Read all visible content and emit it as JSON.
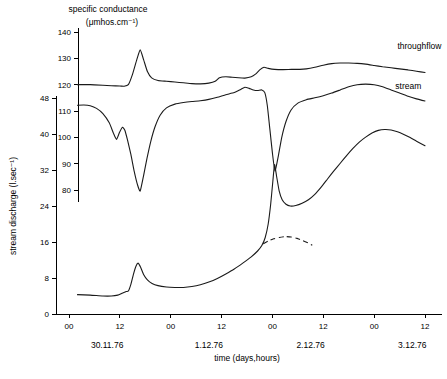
{
  "chart_data": {
    "type": "line",
    "title_line1": "specific conductance",
    "title_line2": "(μmhos.cm⁻¹)",
    "xlabel": "time (days,hours)",
    "ylabel": "stream discharge (l.sec⁻¹)",
    "y2label": "specific conductance (μmhos.cm⁻¹)",
    "grid": false,
    "legend_position": "inline-right-of-curve",
    "xlim": [
      0,
      84
    ],
    "x_unit": "hours from 30.11.76 00:00",
    "x_ticks": [
      {
        "value": 0,
        "label": "00"
      },
      {
        "value": 12,
        "label": "12"
      },
      {
        "value": 24,
        "label": "00"
      },
      {
        "value": 36,
        "label": "12"
      },
      {
        "value": 48,
        "label": "00"
      },
      {
        "value": 60,
        "label": "12"
      },
      {
        "value": 72,
        "label": "00"
      },
      {
        "value": 84,
        "label": "12"
      }
    ],
    "date_labels": [
      {
        "value": 9,
        "label": "30.11.76"
      },
      {
        "value": 33,
        "label": "1.12.76"
      },
      {
        "value": 57,
        "label": "2.12.76"
      },
      {
        "value": 81,
        "label": "3.12.76"
      }
    ],
    "ylim": [
      0,
      48
    ],
    "y_ticks": [
      {
        "value": 0,
        "label": "0"
      },
      {
        "value": 8,
        "label": "8"
      },
      {
        "value": 16,
        "label": "16"
      },
      {
        "value": 24,
        "label": "24"
      },
      {
        "value": 32,
        "label": "32"
      },
      {
        "value": 40,
        "label": "40"
      },
      {
        "value": 48,
        "label": "48"
      }
    ],
    "y2lim": [
      80,
      140
    ],
    "y2_ticks": [
      {
        "value": 80,
        "label": "80"
      },
      {
        "value": 90,
        "label": "90"
      },
      {
        "value": 100,
        "label": "100"
      },
      {
        "value": 110,
        "label": "110"
      },
      {
        "value": 120,
        "label": "120"
      },
      {
        "value": 130,
        "label": "130"
      },
      {
        "value": 140,
        "label": "140"
      }
    ],
    "series": [
      {
        "name": "throughflow",
        "label": "throughflow",
        "axis": "y2",
        "style": "solid",
        "label_x": 77.5,
        "label_y": 134.5,
        "points": [
          [
            2.0,
            120.0
          ],
          [
            5.0,
            120.0
          ],
          [
            8.0,
            119.8
          ],
          [
            10.0,
            119.6
          ],
          [
            12.0,
            119.5
          ],
          [
            13.0,
            119.4
          ],
          [
            14.0,
            120.0
          ],
          [
            15.0,
            124.0
          ],
          [
            16.0,
            129.5
          ],
          [
            16.8,
            133.2
          ],
          [
            17.6,
            129.5
          ],
          [
            18.5,
            125.0
          ],
          [
            19.5,
            122.6
          ],
          [
            21.0,
            121.6
          ],
          [
            23.0,
            121.3
          ],
          [
            25.0,
            121.0
          ],
          [
            27.0,
            120.7
          ],
          [
            29.0,
            120.4
          ],
          [
            31.0,
            120.3
          ],
          [
            33.0,
            120.6
          ],
          [
            34.5,
            121.3
          ],
          [
            35.5,
            122.6
          ],
          [
            37.0,
            123.0
          ],
          [
            38.5,
            122.8
          ],
          [
            40.0,
            122.6
          ],
          [
            41.5,
            122.5
          ],
          [
            43.0,
            123.0
          ],
          [
            44.0,
            124.0
          ],
          [
            45.0,
            125.6
          ],
          [
            46.0,
            126.6
          ],
          [
            47.0,
            126.2
          ],
          [
            48.5,
            125.8
          ],
          [
            50.5,
            125.7
          ],
          [
            52.5,
            125.8
          ],
          [
            54.5,
            125.8
          ],
          [
            56.0,
            126.0
          ],
          [
            58.0,
            126.6
          ],
          [
            60.0,
            127.4
          ],
          [
            62.0,
            128.0
          ],
          [
            64.0,
            128.2
          ],
          [
            66.0,
            128.2
          ],
          [
            68.0,
            128.1
          ],
          [
            70.0,
            127.8
          ],
          [
            72.0,
            127.3
          ],
          [
            74.0,
            126.8
          ],
          [
            76.0,
            126.4
          ],
          [
            78.0,
            126.0
          ],
          [
            80.0,
            125.6
          ],
          [
            82.0,
            125.1
          ],
          [
            84.0,
            124.6
          ]
        ]
      },
      {
        "name": "stream",
        "label": "stream",
        "axis": "y2",
        "style": "solid",
        "label_x": 77.0,
        "label_y": 119.5,
        "points": [
          [
            2.0,
            112.2
          ],
          [
            3.5,
            112.3
          ],
          [
            5.0,
            112.0
          ],
          [
            6.5,
            111.0
          ],
          [
            8.0,
            109.0
          ],
          [
            9.5,
            105.5
          ],
          [
            10.5,
            101.5
          ],
          [
            11.2,
            99.2
          ],
          [
            11.9,
            101.8
          ],
          [
            12.6,
            103.8
          ],
          [
            13.2,
            102.6
          ],
          [
            13.8,
            99.0
          ],
          [
            14.6,
            93.5
          ],
          [
            15.4,
            87.0
          ],
          [
            16.2,
            81.8
          ],
          [
            16.8,
            79.6
          ],
          [
            17.6,
            85.5
          ],
          [
            18.4,
            92.0
          ],
          [
            19.3,
            98.5
          ],
          [
            20.3,
            104.0
          ],
          [
            21.5,
            108.4
          ],
          [
            23.0,
            111.2
          ],
          [
            25.0,
            112.6
          ],
          [
            27.0,
            113.2
          ],
          [
            29.0,
            113.6
          ],
          [
            31.0,
            113.9
          ],
          [
            33.0,
            114.4
          ],
          [
            35.0,
            115.2
          ],
          [
            37.0,
            116.2
          ],
          [
            39.0,
            117.0
          ],
          [
            40.5,
            118.2
          ],
          [
            41.5,
            119.0
          ],
          [
            42.5,
            118.6
          ],
          [
            43.5,
            118.0
          ],
          [
            44.5,
            117.8
          ],
          [
            45.5,
            118.0
          ],
          [
            46.2,
            117.0
          ],
          [
            46.8,
            112.0
          ],
          [
            47.4,
            103.0
          ],
          [
            48.0,
            94.0
          ],
          [
            48.6,
            87.2
          ],
          [
            49.4,
            93.0
          ],
          [
            50.2,
            100.0
          ],
          [
            51.2,
            106.0
          ],
          [
            52.4,
            110.4
          ],
          [
            54.0,
            113.0
          ],
          [
            56.0,
            114.3
          ],
          [
            58.0,
            115.0
          ],
          [
            60.0,
            115.8
          ],
          [
            62.0,
            116.8
          ],
          [
            64.0,
            118.0
          ],
          [
            66.0,
            119.2
          ],
          [
            68.0,
            120.0
          ],
          [
            70.0,
            120.2
          ],
          [
            72.0,
            120.0
          ],
          [
            74.0,
            119.2
          ],
          [
            76.0,
            118.0
          ],
          [
            78.0,
            116.8
          ],
          [
            80.0,
            115.6
          ],
          [
            82.0,
            114.6
          ],
          [
            84.0,
            113.8
          ]
        ]
      },
      {
        "name": "stream-discharge",
        "label": "stream discharge",
        "axis": "y1",
        "style": "solid",
        "points": [
          [
            2.0,
            4.3
          ],
          [
            5.0,
            4.2
          ],
          [
            8.0,
            4.0
          ],
          [
            10.0,
            4.0
          ],
          [
            11.5,
            4.2
          ],
          [
            12.5,
            4.6
          ],
          [
            13.5,
            5.0
          ],
          [
            14.0,
            5.1
          ],
          [
            14.6,
            6.6
          ],
          [
            15.2,
            8.8
          ],
          [
            15.8,
            10.6
          ],
          [
            16.3,
            11.3
          ],
          [
            16.9,
            10.4
          ],
          [
            17.6,
            8.8
          ],
          [
            18.5,
            7.6
          ],
          [
            19.6,
            6.8
          ],
          [
            21.0,
            6.3
          ],
          [
            23.0,
            6.0
          ],
          [
            25.0,
            5.9
          ],
          [
            27.0,
            5.9
          ],
          [
            29.0,
            6.1
          ],
          [
            31.0,
            6.5
          ],
          [
            33.0,
            7.1
          ],
          [
            35.0,
            7.9
          ],
          [
            37.0,
            8.9
          ],
          [
            39.0,
            10.0
          ],
          [
            41.0,
            11.3
          ],
          [
            43.0,
            12.7
          ],
          [
            44.5,
            14.0
          ],
          [
            45.5,
            15.2
          ],
          [
            46.3,
            17.0
          ],
          [
            47.0,
            20.0
          ],
          [
            47.6,
            24.5
          ],
          [
            48.1,
            29.5
          ],
          [
            48.5,
            33.2
          ],
          [
            49.0,
            30.5
          ],
          [
            49.6,
            27.3
          ],
          [
            50.3,
            25.4
          ],
          [
            51.2,
            24.4
          ],
          [
            52.2,
            24.0
          ],
          [
            53.5,
            24.1
          ],
          [
            55.0,
            24.6
          ],
          [
            56.5,
            25.4
          ],
          [
            58.0,
            26.6
          ],
          [
            59.5,
            28.2
          ],
          [
            61.0,
            30.0
          ],
          [
            62.5,
            31.8
          ],
          [
            64.0,
            33.5
          ],
          [
            65.5,
            35.2
          ],
          [
            67.0,
            36.8
          ],
          [
            68.5,
            38.2
          ],
          [
            70.0,
            39.3
          ],
          [
            71.5,
            40.2
          ],
          [
            73.0,
            40.8
          ],
          [
            74.5,
            41.0
          ],
          [
            76.0,
            40.9
          ],
          [
            77.5,
            40.5
          ],
          [
            79.0,
            39.9
          ],
          [
            80.5,
            39.2
          ],
          [
            82.0,
            38.4
          ],
          [
            84.0,
            37.4
          ]
        ]
      },
      {
        "name": "stream-discharge-projected",
        "label": "projected recession",
        "axis": "y1",
        "style": "dashed",
        "points": [
          [
            45.8,
            15.6
          ],
          [
            47.0,
            16.2
          ],
          [
            48.3,
            16.7
          ],
          [
            49.6,
            17.0
          ],
          [
            51.0,
            17.2
          ],
          [
            52.4,
            17.1
          ],
          [
            53.8,
            16.8
          ],
          [
            55.2,
            16.3
          ],
          [
            56.4,
            15.8
          ],
          [
            57.4,
            15.3
          ]
        ]
      }
    ]
  }
}
